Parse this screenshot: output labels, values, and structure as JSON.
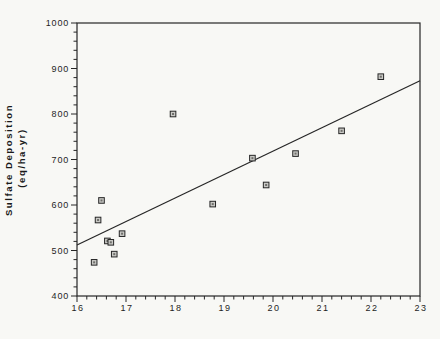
{
  "figure": {
    "background": "#f8f8f5",
    "ink": "#262626",
    "marker_fill": "#c9c9c5",
    "marker_core": "#6e6e6a"
  },
  "chart_data": {
    "type": "scatter",
    "title": "",
    "xlabel": "",
    "ylabel_line1": "Sulfate  Deposition",
    "ylabel_line2": "(eq/ha-yr)",
    "xlim": [
      16,
      23
    ],
    "ylim": [
      400,
      1000
    ],
    "x_major_step": 1,
    "x_minor_step": 0.2,
    "y_major_step": 100,
    "y_minor_step": 20,
    "x_tick_labels": [
      "16",
      "17",
      "18",
      "19",
      "20",
      "21",
      "22",
      "23"
    ],
    "y_tick_labels": [
      "400",
      "500",
      "600",
      "700",
      "800",
      "900",
      "1000"
    ],
    "grid": false,
    "legend": null,
    "marker": "open-square",
    "points": [
      [
        16.35,
        474
      ],
      [
        16.43,
        567
      ],
      [
        16.5,
        610
      ],
      [
        16.62,
        521
      ],
      [
        16.69,
        518
      ],
      [
        16.76,
        492
      ],
      [
        16.92,
        537
      ],
      [
        17.96,
        800
      ],
      [
        18.77,
        602
      ],
      [
        19.58,
        703
      ],
      [
        19.86,
        644
      ],
      [
        20.46,
        713
      ],
      [
        21.4,
        763
      ],
      [
        22.2,
        882
      ]
    ],
    "trendline": {
      "x1": 16,
      "y1": 512,
      "x2": 23,
      "y2": 873
    }
  }
}
